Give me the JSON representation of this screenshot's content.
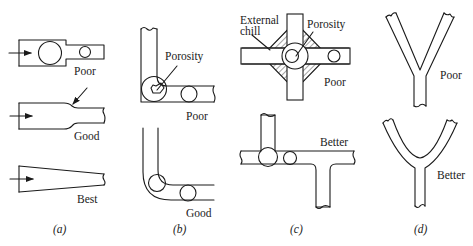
{
  "figure": {
    "panels": [
      {
        "id": "a",
        "caption": "(a)",
        "variants": [
          {
            "rating": "Poor",
            "description": "Abrupt section change with flow arrow; large and small circles inscribed"
          },
          {
            "rating": "Good",
            "description": "Tapered transition between thick and thin section with arrow pointing to taper"
          },
          {
            "rating": "Best",
            "description": "Continuously tapered section"
          }
        ]
      },
      {
        "id": "b",
        "caption": "(b)",
        "variants": [
          {
            "rating": "Poor",
            "callout": "Porosity",
            "description": "Sharp L-corner with porosity in inscribed circle"
          },
          {
            "rating": "Good",
            "description": "Rounded L-corner with uniform inscribed circles"
          }
        ]
      },
      {
        "id": "c",
        "caption": "(c)",
        "variants": [
          {
            "rating": "Poor",
            "callouts": [
              "External chill",
              "Porosity"
            ],
            "description": "Cross junction with external chill and porosity"
          },
          {
            "rating": "Better",
            "description": "Staggered T-junctions"
          }
        ]
      },
      {
        "id": "d",
        "caption": "(d)",
        "variants": [
          {
            "rating": "Poor",
            "description": "Sharp Y-junction"
          },
          {
            "rating": "Better",
            "description": "Rounded Y-junction"
          }
        ]
      }
    ]
  },
  "labels": {
    "a_poor": "Poor",
    "a_good": "Good",
    "a_best": "Best",
    "a_caption": "(a)",
    "b_porosity": "Porosity",
    "b_poor": "Poor",
    "b_good": "Good",
    "b_caption": "(b)",
    "c_external": "External",
    "c_chill": "chill",
    "c_porosity": "Porosity",
    "c_poor": "Poor",
    "c_better": "Better",
    "c_caption": "(c)",
    "d_poor": "Poor",
    "d_better": "Better",
    "d_caption": "(d)"
  },
  "colors": {
    "line": "#1a1a1a",
    "background": "#ffffff"
  }
}
